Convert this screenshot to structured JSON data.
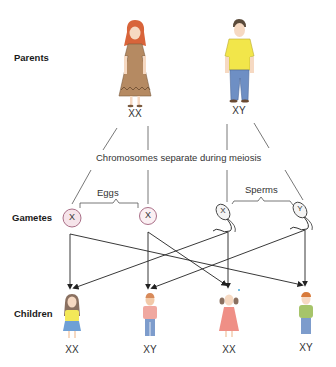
{
  "rows": {
    "parents_label": "Parents",
    "gametes_label": "Gametes",
    "children_label": "Children"
  },
  "parents": [
    {
      "name": "mother",
      "genotype": "XX"
    },
    {
      "name": "father",
      "genotype": "XY"
    }
  ],
  "process_label": "Chromosomes separate during meiosis",
  "gametes": {
    "eggs_label": "Eggs",
    "sperms_label": "Sperms",
    "eggs": [
      {
        "chromosome": "X"
      },
      {
        "chromosome": "X"
      }
    ],
    "sperms": [
      {
        "chromosome": "X"
      },
      {
        "chromosome": "Y"
      }
    ]
  },
  "children": [
    {
      "sex": "girl",
      "genotype": "XX"
    },
    {
      "sex": "boy",
      "genotype": "XY"
    },
    {
      "sex": "girl",
      "genotype": "XX"
    },
    {
      "sex": "boy",
      "genotype": "XY"
    }
  ],
  "colors": {
    "egg_fill": "#f6e4ea",
    "egg_stroke": "#a0607a",
    "mother_dress": "#b58a62",
    "father_shirt": "#f2e64a",
    "father_pants": "#6e8fc4",
    "child1_shirt": "#f3e858",
    "child1_skirt": "#6fa0d6",
    "child2_shirt": "#f0a8a0",
    "child3_dress": "#ef8f86",
    "child4_shirt": "#a6c46a"
  }
}
